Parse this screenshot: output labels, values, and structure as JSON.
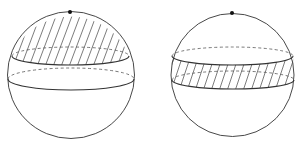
{
  "figure": {
    "left": {
      "label": "spherical-cap",
      "shaded_region": "cap",
      "pole_marker": true
    },
    "right": {
      "label": "spherical-zone",
      "shaded_region": "band",
      "pole_marker": true
    },
    "colors": {
      "stroke": "#333333",
      "background": "#ffffff"
    }
  }
}
